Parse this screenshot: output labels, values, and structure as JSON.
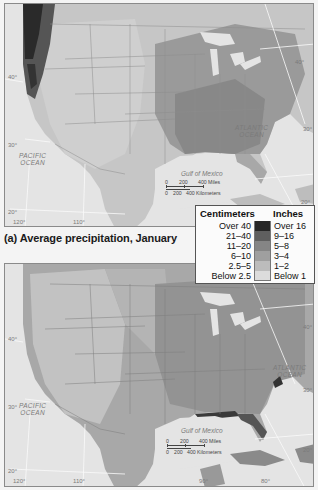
{
  "figure": {
    "caption_a": "(a) Average precipitation, January",
    "legend": {
      "header_cm": "Centimeters",
      "header_in": "Inches",
      "classes": [
        {
          "cm": "Over 40",
          "in": "Over 16",
          "color": "#262626"
        },
        {
          "cm": "21–40",
          "in": "9–16",
          "color": "#5f5f5f"
        },
        {
          "cm": "11–20",
          "in": "5–8",
          "color": "#858585"
        },
        {
          "cm": "6–10",
          "in": "3–4",
          "color": "#9f9f9f"
        },
        {
          "cm": "2.5–5",
          "in": "1–2",
          "color": "#bcbcbc"
        },
        {
          "cm": "Below 2.5",
          "in": "Below 1",
          "color": "#dcdcdc"
        }
      ]
    }
  },
  "maps": [
    {
      "id": "a",
      "labels": {
        "atlantic": "ATLANTIC\nOCEAN",
        "pacific": "PACIFIC\nOCEAN",
        "gulf": "Gulf of Mexico"
      },
      "degrees": {
        "lat40": "40°",
        "lat30": "30°",
        "lat20": "20°",
        "lon120": "120°",
        "lon110": "110°",
        "lat40e": "40°",
        "lat30e": "30°",
        "lat20e": "20°"
      },
      "scale": {
        "miles": [
          "0",
          "200",
          "400 Miles"
        ],
        "km": [
          "0",
          "200",
          "400 Kilometers"
        ]
      }
    },
    {
      "id": "b",
      "labels": {
        "atlantic": "ATLANTIC\nOCEAN",
        "pacific": "PACIFIC\nOCEAN",
        "gulf": "Gulf of Mexico"
      },
      "degrees": {
        "lat40": "40°",
        "lat30": "30°",
        "lat20": "20°",
        "lon120": "120°",
        "lon110": "110°",
        "lon90": "90°",
        "lon80": "80°",
        "lat40e": "40°",
        "lat30e": "30°",
        "lat20e": "20°"
      },
      "scale": {
        "miles": [
          "0",
          "200",
          "400 Miles"
        ],
        "km": [
          "0",
          "200",
          "400 Kilometers"
        ]
      }
    }
  ]
}
